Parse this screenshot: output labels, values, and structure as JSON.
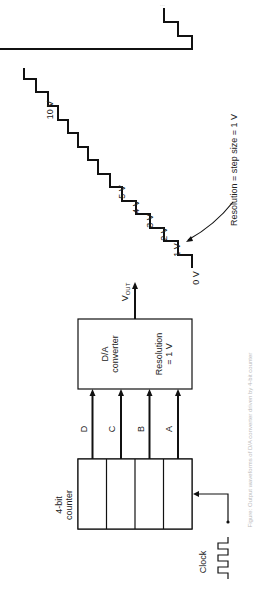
{
  "figure": {
    "rotation_deg": -90,
    "counter": {
      "label_line1": "4-bit",
      "label_line2": "counter"
    },
    "clock": {
      "label": "Clock"
    },
    "bits": [
      "D",
      "C",
      "B",
      "A"
    ],
    "dac": {
      "line1": "D/A",
      "line2": "converter",
      "line3": "Resolution",
      "line4": "= 1 V"
    },
    "output": {
      "label": "V",
      "subscript": "OUT"
    },
    "staircase": {
      "step_labels": [
        "0 V",
        "1 V",
        "2 V",
        "3 V",
        "4 V",
        "5 V",
        "10 V"
      ],
      "annotation": "Resolution = step size = 1 V"
    },
    "caption": "Figure: Output waveforms of D/A converter driven by 4-bit counter"
  }
}
